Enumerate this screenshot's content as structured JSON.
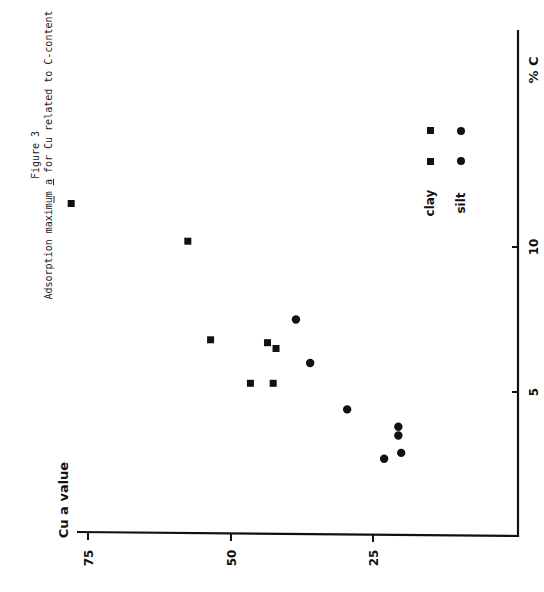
{
  "figure": {
    "figure_label": "Figure 3",
    "title_prefix": "Adsorption maximum ",
    "title_underlined": "a",
    "title_suffix": " for Cu related to C-content",
    "orientation": "rotated 90° counter-clockwise"
  },
  "axes": {
    "x_label": "% C",
    "y_label": "Cu a value",
    "x_ticks": [
      "5",
      "10"
    ],
    "y_ticks": [
      "25",
      "50",
      "75"
    ]
  },
  "legend": {
    "items": [
      {
        "label": "clay",
        "marker": "square"
      },
      {
        "label": "silt",
        "marker": "circle"
      }
    ]
  },
  "chart_data": {
    "type": "scatter",
    "xlabel": "% C",
    "ylabel": "Cu a value",
    "xlim": [
      0,
      15
    ],
    "ylim": [
      0,
      78
    ],
    "x_ticks": [
      5,
      10
    ],
    "y_ticks": [
      25,
      50,
      75
    ],
    "grid": false,
    "legend_position": "upper right (in rotated frame)",
    "series": [
      {
        "name": "clay",
        "marker": "square",
        "points": [
          {
            "x": 11.5,
            "y": 78
          },
          {
            "x": 10.2,
            "y": 57.5
          },
          {
            "x": 6.8,
            "y": 53.5
          },
          {
            "x": 6.7,
            "y": 43.5
          },
          {
            "x": 6.5,
            "y": 42
          },
          {
            "x": 5.3,
            "y": 46.5
          },
          {
            "x": 5.3,
            "y": 42.5
          }
        ]
      },
      {
        "name": "silt",
        "marker": "circle",
        "points": [
          {
            "x": 7.5,
            "y": 38.5
          },
          {
            "x": 6.0,
            "y": 36
          },
          {
            "x": 4.4,
            "y": 29.5
          },
          {
            "x": 3.8,
            "y": 20.5
          },
          {
            "x": 3.5,
            "y": 20.5
          },
          {
            "x": 2.7,
            "y": 23
          },
          {
            "x": 2.9,
            "y": 20
          }
        ]
      }
    ]
  }
}
